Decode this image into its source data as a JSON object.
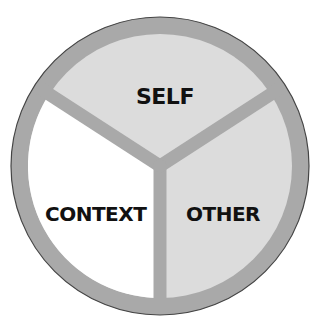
{
  "diagram": {
    "type": "segmented-circle",
    "segments": [
      {
        "id": "self",
        "label": "SELF",
        "fill": "#dcdcdc"
      },
      {
        "id": "context",
        "label": "CONTEXT",
        "fill": "#ffffff"
      },
      {
        "id": "other",
        "label": "OTHER",
        "fill": "#dcdcdc"
      }
    ],
    "colors": {
      "ring": "#a9a9a9",
      "divider": "#a9a9a9",
      "outline": "#444444",
      "text": "#111111"
    }
  }
}
